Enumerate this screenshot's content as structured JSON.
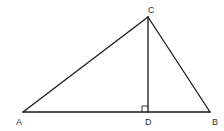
{
  "figure": {
    "type": "triangle-with-altitude",
    "points": {
      "A": {
        "label": "A",
        "x": 23,
        "y": 112,
        "label_x": 16,
        "label_y": 125
      },
      "B": {
        "label": "B",
        "x": 210,
        "y": 112,
        "label_x": 212,
        "label_y": 125
      },
      "C": {
        "label": "C",
        "x": 148,
        "y": 17,
        "label_x": 148,
        "label_y": 13
      },
      "D": {
        "label": "D",
        "x": 148,
        "y": 112,
        "label_x": 145,
        "label_y": 125
      }
    },
    "segments": [
      {
        "name": "AB",
        "from": "A",
        "to": "B"
      },
      {
        "name": "AC",
        "from": "A",
        "to": "C"
      },
      {
        "name": "BC",
        "from": "B",
        "to": "C"
      },
      {
        "name": "CD",
        "from": "C",
        "to": "D"
      }
    ],
    "right_angle": {
      "at": "D",
      "size": 6
    },
    "colors": {
      "stroke": "#1a1a1a",
      "label": "#333333",
      "background": "#ffffff"
    }
  }
}
